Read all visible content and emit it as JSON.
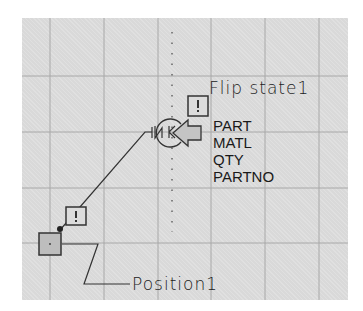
{
  "diagram": {
    "flip_state_label": "Flip state1",
    "position_label": "Position1",
    "parameters": [
      "PART",
      "MATL",
      "QTY",
      "PARTNO"
    ],
    "warning_glyph": "!",
    "colors": {
      "background": "#d9d9d9",
      "grid": "#a8a8a8",
      "stroke": "#333333",
      "node_fill": "#bdbdbd",
      "arrow_fill": "#c4c4c4"
    }
  }
}
